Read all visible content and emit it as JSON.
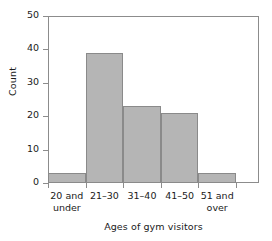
{
  "chart_data": {
    "type": "bar",
    "title": "",
    "subtitle": "",
    "xlabel": "Ages of gym visitors",
    "ylabel": "Count",
    "categories": [
      "20 and under",
      "21–30",
      "31–40",
      "41–50",
      "51 and over"
    ],
    "category_lines": [
      [
        "20 and",
        "under"
      ],
      [
        "21–30",
        ""
      ],
      [
        "31–40",
        ""
      ],
      [
        "41–50",
        ""
      ],
      [
        "51 and",
        "over"
      ]
    ],
    "values": [
      3,
      39,
      23,
      21,
      3
    ],
    "ylim": [
      0,
      50
    ],
    "yticks": [
      0,
      10,
      20,
      30,
      40,
      50
    ],
    "ytick_labels": [
      "0",
      "10",
      "20",
      "30",
      "40",
      "50"
    ],
    "xlim": [
      0,
      5
    ],
    "grid": false,
    "legend": false,
    "legend_position": "none",
    "bar_fill_color": "#b5b5b5",
    "bar_edge_color": "#8a8a8a",
    "frame_color": "#8c8c8c",
    "background_color": "#ffffff",
    "text_color": "#1a1a1a",
    "annotations": []
  }
}
